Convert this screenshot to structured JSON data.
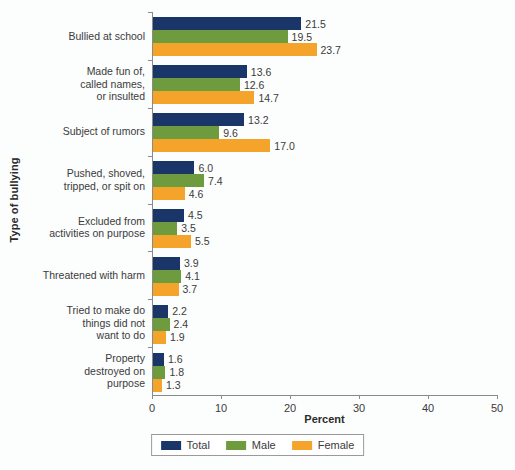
{
  "chart_data": {
    "type": "bar",
    "orientation": "horizontal",
    "title": "",
    "xlabel": "Percent",
    "ylabel": "Type of bullying",
    "xlim": [
      0,
      50
    ],
    "xticks": [
      0,
      10,
      20,
      30,
      40,
      50
    ],
    "grid": false,
    "legend_position": "bottom-center",
    "categories": [
      "Bullied at school",
      "Made fun of,\ncalled names,\nor insulted",
      "Subject of rumors",
      "Pushed, shoved,\ntripped, or spit on",
      "Excluded from\nactivities on purpose",
      "Threatened with harm",
      "Tried to make do\nthings did not\nwant to do",
      "Property\ndestroyed on\npurpose"
    ],
    "series": [
      {
        "name": "Total",
        "color": "#1a3668",
        "values": [
          21.5,
          13.6,
          13.2,
          6.0,
          4.5,
          3.9,
          2.2,
          1.6
        ],
        "labels": [
          "21.5",
          "13.6",
          "13.2",
          "6.0",
          "4.5",
          "3.9",
          "2.2",
          "1.6"
        ]
      },
      {
        "name": "Male",
        "color": "#6d9b3e",
        "values": [
          19.5,
          12.6,
          9.6,
          7.4,
          3.5,
          4.1,
          2.4,
          1.8
        ],
        "labels": [
          "19.5",
          "12.6",
          "9.6",
          "7.4",
          "3.5",
          "4.1",
          "2.4",
          "1.8"
        ]
      },
      {
        "name": "Female",
        "color": "#f4a42a",
        "values": [
          23.7,
          14.7,
          17.0,
          4.6,
          5.5,
          3.7,
          1.9,
          1.3
        ],
        "labels": [
          "23.7",
          "14.7",
          "17.0",
          "4.6",
          "5.5",
          "3.7",
          "1.9",
          "1.3"
        ]
      }
    ]
  },
  "axes": {
    "x_title": "Percent",
    "y_title": "Type of bullying",
    "x_tick_labels": [
      "0",
      "10",
      "20",
      "30",
      "40",
      "50"
    ]
  },
  "legend": {
    "entries": [
      {
        "label": "Total",
        "key": "total"
      },
      {
        "label": "Male",
        "key": "male"
      },
      {
        "label": "Female",
        "key": "female"
      }
    ]
  }
}
